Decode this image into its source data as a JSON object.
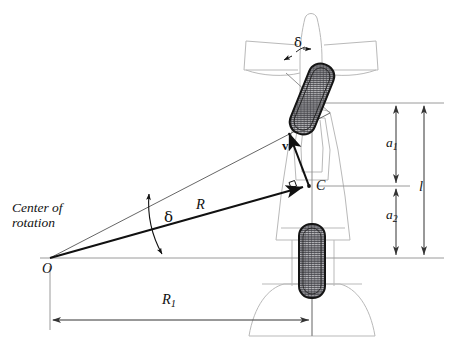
{
  "figure": {
    "type": "engineering-diagram",
    "background_color": "#ffffff",
    "ink_color": "#111111",
    "body_outline_color": "#b9b9b9",
    "reference_line_color": "#9a9a9a",
    "tire_color": "#2b2b2b"
  },
  "labels": {
    "center_of_rotation_line1": "Center of",
    "center_of_rotation_line2": "rotation",
    "origin": "O",
    "cg": "C",
    "radius_to_cg": "R",
    "radius_rear": "R",
    "radius_rear_sub": "1",
    "wheelbase": "l",
    "dist_front": "a",
    "dist_front_sub": "1",
    "dist_rear": "a",
    "dist_rear_sub": "2",
    "steer_angle": "δ",
    "steer_angle_top": "δ",
    "velocity": "v"
  },
  "geometry": {
    "origin_point": {
      "x": 50,
      "y": 258
    },
    "cg_point": {
      "x": 309,
      "y": 186
    },
    "front_axle_y": 103,
    "rear_axle_y": 258,
    "vehicle_centerline_x": 312,
    "front_wheel_tilt_deg": 22,
    "dimension_line_a_x": 396,
    "dimension_line_l_x": 424,
    "dimension_line_R1_y": 320
  },
  "annotations": {
    "right_angle_marker_at_C": true,
    "velocity_vector_direction": "up-left, perpendicular to R",
    "steer_angle_arc_at_O": "between line O-front-wheel and horizontal",
    "steer_angle_arc_at_front_wheel": "between wheel plane and vehicle centerline"
  }
}
